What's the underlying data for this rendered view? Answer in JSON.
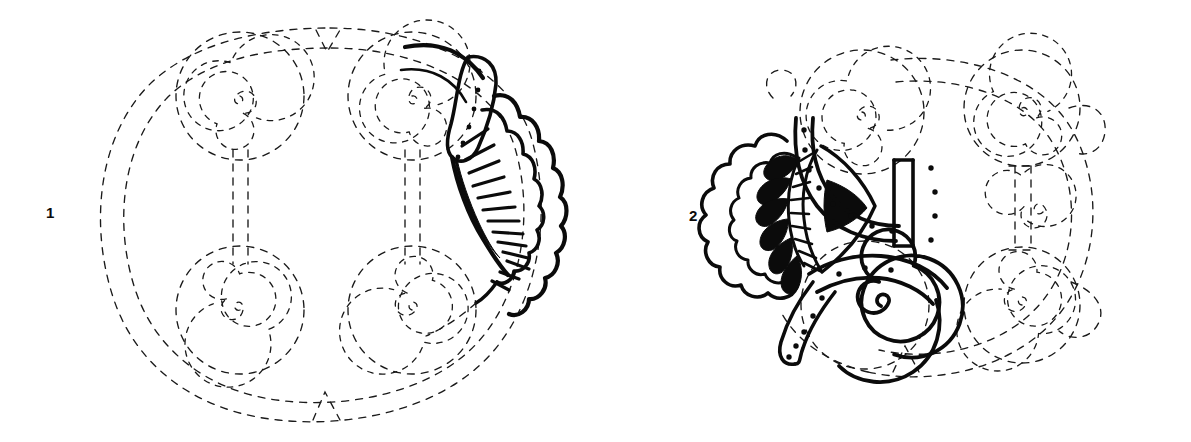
{
  "plate": {
    "title": "Reconstruction drawing of two ornamented discs",
    "background_color": "#ffffff",
    "ink_color": "#0b0b0b",
    "width": 1191,
    "height": 442
  },
  "figures": [
    {
      "id": "figure-1",
      "label": "1",
      "label_position": {
        "x": 46,
        "y": 205
      },
      "description": "Circular disc with four dashed spiral bosses and a solid surviving fan-shaped ornament on the right edge",
      "center": {
        "x": 330,
        "y": 215
      },
      "outer_radius": 185,
      "surviving_fragment": "right-edge fan with dotted band and radiating ribs",
      "reconstructed": "outer rim, four spirals, two vertical stems",
      "spiral_count": 4,
      "spirals": [
        {
          "name": "spiral-top-left",
          "cx": 240,
          "cy": 96,
          "r": 62,
          "turns": 3.4
        },
        {
          "name": "spiral-top-right",
          "cx": 412,
          "cy": 96,
          "r": 62,
          "turns": 3.4
        },
        {
          "name": "spiral-bottom-left",
          "cx": 240,
          "cy": 310,
          "r": 62,
          "turns": 3.4
        },
        {
          "name": "spiral-bottom-right",
          "cx": 412,
          "cy": 310,
          "r": 62,
          "turns": 3.4
        }
      ],
      "stems": [
        {
          "name": "stem-left",
          "x": 240,
          "y_top": 152,
          "y_bottom": 262
        },
        {
          "name": "stem-right",
          "x": 412,
          "y_top": 152,
          "y_bottom": 262
        }
      ],
      "ornament": {
        "name": "fan-ornament",
        "dot_count": 6,
        "rib_count": 13,
        "has_black_sliver": true
      }
    },
    {
      "id": "figure-2",
      "label": "2",
      "label_position": {
        "x": 689,
        "y": 208
      },
      "description": "Circular disc with four dashed spiral bosses; the left portion survives as a solid ornament with black fan petals, a triangular inlay, a dotted collar and a volute spiral",
      "center": {
        "x": 945,
        "y": 215
      },
      "outer_radius": 180,
      "surviving_fragment": "left fan, dotted collar bands, central triangle, solid volute spiral and dotted tail",
      "reconstructed": "right half of rim, two right spirals, right stem",
      "spiral_count": 4,
      "spirals": [
        {
          "name": "spiral-top-left-solid-partial",
          "cx": 862,
          "cy": 112,
          "r": 58,
          "turns": 3.2
        },
        {
          "name": "spiral-top-right",
          "cx": 1022,
          "cy": 108,
          "r": 58,
          "turns": 3.2
        },
        {
          "name": "spiral-bottom-left-volute",
          "cx": 862,
          "cy": 305,
          "r": 60,
          "turns": 3.0
        },
        {
          "name": "spiral-bottom-right",
          "cx": 1022,
          "cy": 305,
          "r": 58,
          "turns": 3.2
        }
      ],
      "stems": [
        {
          "name": "stem-left-solid",
          "x": 862,
          "y_top": 168,
          "y_bottom": 248
        },
        {
          "name": "stem-right-dashed",
          "x": 1022,
          "y_top": 166,
          "y_bottom": 250
        }
      ],
      "ornament": {
        "name": "fan-ornament",
        "black_petal_count": 6,
        "block_count": 9,
        "has_black_triangle": true,
        "collar_dot_count": 14,
        "tail_dot_count": 6
      }
    }
  ],
  "legend": {
    "solid_line_meaning": "surviving original fragment",
    "dashed_line_meaning": "reconstructed / restored outline"
  }
}
